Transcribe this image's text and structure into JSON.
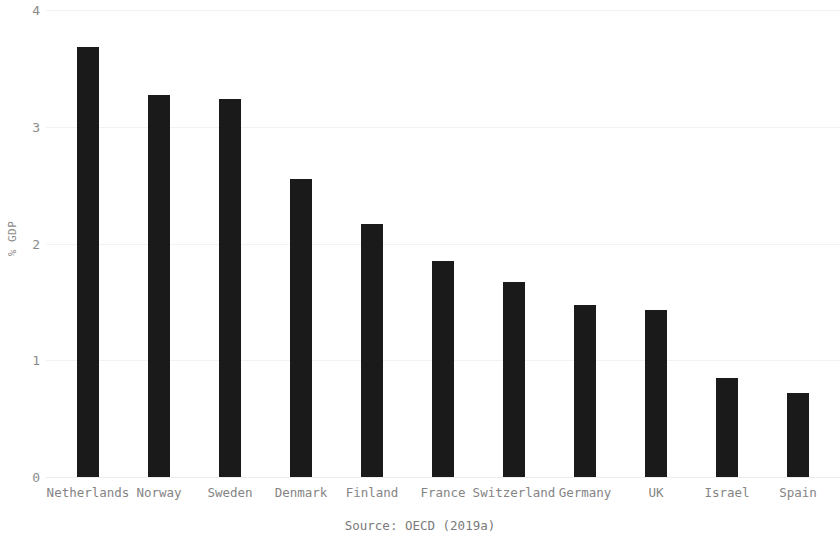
{
  "chart_data": {
    "type": "bar",
    "title": "",
    "subtitle": "",
    "xlabel": "",
    "ylabel": "% GDP",
    "categories": [
      "Netherlands",
      "Norway",
      "Sweden",
      "Denmark",
      "Finland",
      "France",
      "Switzerland",
      "Germany",
      "UK",
      "Israel",
      "Spain"
    ],
    "values": [
      3.68,
      3.27,
      3.24,
      2.55,
      2.17,
      1.85,
      1.67,
      1.47,
      1.43,
      0.85,
      0.72
    ],
    "series": [
      {
        "name": "% GDP",
        "values": [
          3.68,
          3.27,
          3.24,
          2.55,
          2.17,
          1.85,
          1.67,
          1.47,
          1.43,
          0.85,
          0.72
        ]
      }
    ],
    "ylim": [
      0,
      4
    ],
    "yticks": [
      0,
      1,
      2,
      3,
      4
    ],
    "ytick_labels": [
      "0",
      "1",
      "2",
      "3",
      "4"
    ],
    "grid": "horizontal",
    "legend": "none",
    "bar_color": "#1a1a1a",
    "grid_color": "#f2f2f2",
    "tick_label_color": "#8a8a8a",
    "source": "Source: OECD (2019a)"
  }
}
